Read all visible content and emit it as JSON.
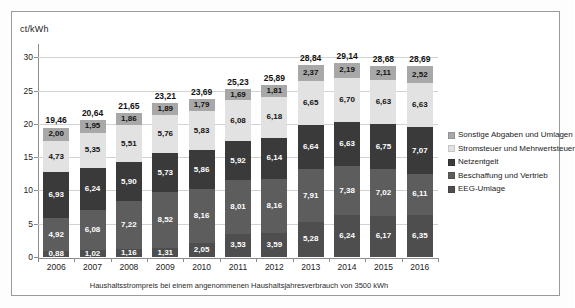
{
  "axis_unit": "ct/kWh",
  "caption": "Haushaltsstrompreis bei einem angenommenen Haushaltsjahresverbrauch von 3500 kWh",
  "legend": {
    "items": [
      {
        "label": "Sonstige Abgaben und Umlagen",
        "color": "#a8a8a8"
      },
      {
        "label": "Stromsteuer und Mehrwertsteuer",
        "color": "#e2e2e2"
      },
      {
        "label": "Netzentgelt",
        "color": "#3a3a3a"
      },
      {
        "label": "Beschaffung und Vertrieb",
        "color": "#5d5d5d"
      },
      {
        "label": "EEG-Umlage",
        "color": "#4e4e4e"
      }
    ]
  },
  "chart_data": {
    "type": "bar",
    "stacked": true,
    "title": "",
    "xlabel": "",
    "ylabel": "ct/kWh",
    "ylim": [
      0,
      32
    ],
    "yticks": [
      0,
      5,
      10,
      15,
      20,
      25,
      30
    ],
    "ytick_labels": [
      "0",
      "5",
      "10",
      "15",
      "20",
      "25",
      "30"
    ],
    "grid": true,
    "legend_position": "right",
    "categories": [
      "2006",
      "2007",
      "2008",
      "2009",
      "2010",
      "2011",
      "2012",
      "2013",
      "2014",
      "2015",
      "2016"
    ],
    "series": [
      {
        "name": "EEG-Umlage",
        "color": "#4e4e4e",
        "values": [
          0.88,
          1.02,
          1.16,
          1.31,
          2.05,
          3.53,
          3.59,
          5.28,
          6.24,
          6.17,
          6.35
        ],
        "labels": [
          "0,88",
          "1,02",
          "1,16",
          "1,31",
          "2,05",
          "3,53",
          "3,59",
          "5,28",
          "6,24",
          "6,17",
          "6,35"
        ]
      },
      {
        "name": "Beschaffung und Vertrieb",
        "color": "#5d5d5d",
        "values": [
          4.92,
          6.08,
          7.22,
          8.52,
          8.16,
          8.01,
          8.16,
          7.91,
          7.38,
          7.02,
          6.11
        ],
        "labels": [
          "4,92",
          "6,08",
          "7,22",
          "8,52",
          "8,16",
          "8,01",
          "8,16",
          "7,91",
          "7,38",
          "7,02",
          "6,11"
        ]
      },
      {
        "name": "Netzentgelt",
        "color": "#3a3a3a",
        "values": [
          6.93,
          6.24,
          5.9,
          5.73,
          5.86,
          5.92,
          6.14,
          6.64,
          6.63,
          6.75,
          7.07
        ],
        "labels": [
          "6,93",
          "6,24",
          "5,90",
          "5,73",
          "5,86",
          "5,92",
          "6,14",
          "6,64",
          "6,63",
          "6,75",
          "7,07"
        ]
      },
      {
        "name": "Stromsteuer und Mehrwertsteuer",
        "color": "#e2e2e2",
        "values": [
          4.73,
          5.35,
          5.51,
          5.76,
          5.83,
          6.08,
          6.18,
          6.65,
          6.7,
          6.63,
          6.63
        ],
        "labels": [
          "4,73",
          "5,35",
          "5,51",
          "5,76",
          "5,83",
          "6,08",
          "6,18",
          "6,65",
          "6,70",
          "6,63",
          "6,63"
        ]
      },
      {
        "name": "Sonstige Abgaben und Umlagen",
        "color": "#a8a8a8",
        "values": [
          2.0,
          1.95,
          1.86,
          1.89,
          1.79,
          1.69,
          1.81,
          2.37,
          2.19,
          2.11,
          2.52
        ],
        "labels": [
          "2,00",
          "1,95",
          "1,86",
          "1,89",
          "1,79",
          "1,69",
          "1,81",
          "2,37",
          "2,19",
          "2,11",
          "2,52"
        ]
      }
    ],
    "totals": [
      19.46,
      20.64,
      21.65,
      23.21,
      23.69,
      25.23,
      25.89,
      28.84,
      29.14,
      28.68,
      28.69
    ],
    "total_labels": [
      "19,46",
      "20,64",
      "21,65",
      "23,21",
      "23,69",
      "25,23",
      "25,89",
      "28,84",
      "29,14",
      "28,68",
      "28,69"
    ]
  }
}
